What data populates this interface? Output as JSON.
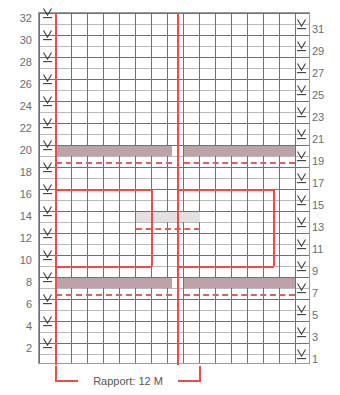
{
  "chart_data": {
    "type": "table",
    "title": "",
    "kind": "knitting-stitch-chart",
    "columns": 17,
    "rows": 32,
    "row_numbers_left": [
      32,
      30,
      28,
      26,
      24,
      22,
      20,
      18,
      16,
      14,
      12,
      10,
      8,
      6,
      4,
      2
    ],
    "row_numbers_right": [
      31,
      29,
      27,
      25,
      23,
      21,
      19,
      17,
      15,
      13,
      11,
      9,
      7,
      5,
      3,
      1
    ],
    "symbol_glyph": "V-underlined",
    "symbol_column_left_rows": [
      32,
      30,
      28,
      26,
      24,
      22,
      20,
      18,
      16,
      14,
      12,
      10,
      8,
      6,
      4,
      2
    ],
    "symbol_column_right_rows": [
      31,
      29,
      27,
      25,
      23,
      21,
      19,
      17,
      15,
      13,
      11,
      9,
      7,
      5,
      3,
      1
    ],
    "colored_bands": [
      {
        "row": 19,
        "color": "#bfa2a8",
        "name": "mauve-band-row-19"
      },
      {
        "row": 13,
        "color": "#e4dfe1",
        "name": "grey-band-row-13"
      },
      {
        "row": 7,
        "color": "#bfa2a8",
        "name": "mauve-band-row-7"
      }
    ],
    "dashed_guides": [
      {
        "row": 18,
        "color": "#e06060"
      },
      {
        "row": 12,
        "color": "#e06060"
      },
      {
        "row": 6,
        "color": "#e06060"
      }
    ],
    "repeat_outline_color": "#ef4b4b",
    "grid_minor_color": "#b8bbbe",
    "grid_major_color": "#6e7276",
    "border_color": "#9a9da1"
  },
  "footer": {
    "rapport_label": "Rapport: 12 M"
  }
}
